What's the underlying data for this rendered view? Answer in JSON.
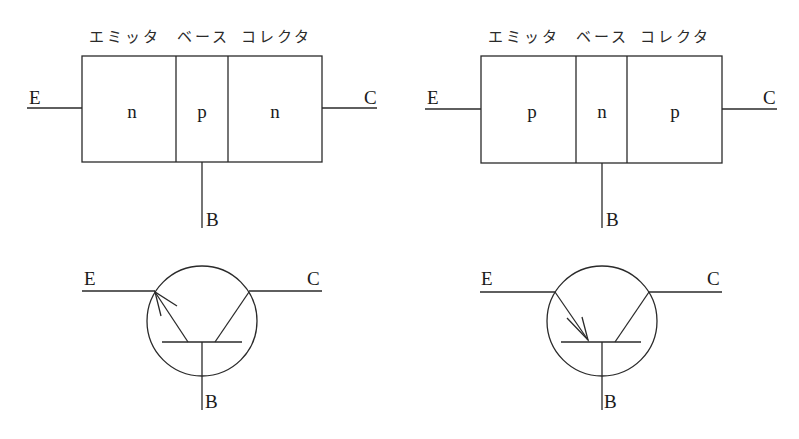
{
  "diagrams": {
    "npn_structure": {
      "type": "npn",
      "headers": [
        "エミッタ",
        "ベース",
        "コレクタ"
      ],
      "regions": [
        "n",
        "p",
        "n"
      ],
      "terminals": {
        "emitter": "E",
        "base": "B",
        "collector": "C"
      }
    },
    "pnp_structure": {
      "type": "pnp",
      "headers": [
        "エミッタ",
        "ベース",
        "コレクタ"
      ],
      "regions": [
        "p",
        "n",
        "p"
      ],
      "terminals": {
        "emitter": "E",
        "base": "B",
        "collector": "C"
      }
    },
    "npn_symbol": {
      "type": "npn",
      "arrow_direction": "outward",
      "terminals": {
        "emitter": "E",
        "base": "B",
        "collector": "C"
      }
    },
    "pnp_symbol": {
      "type": "pnp",
      "arrow_direction": "inward",
      "terminals": {
        "emitter": "E",
        "base": "B",
        "collector": "C"
      }
    }
  },
  "colors": {
    "line": "#2a2a2a",
    "background": "#ffffff"
  }
}
